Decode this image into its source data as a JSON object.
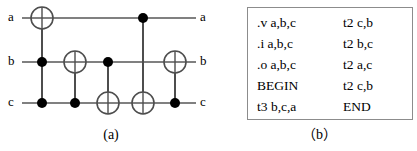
{
  "figure": {
    "panel_a": {
      "caption": "(a)",
      "type": "quantum-circuit",
      "wires": [
        {
          "id": "a",
          "left_label": "a",
          "right_label": "a",
          "y": 18
        },
        {
          "id": "b",
          "left_label": "b",
          "right_label": "b",
          "y": 62
        },
        {
          "id": "c",
          "left_label": "c",
          "right_label": "c",
          "y": 103
        }
      ],
      "wire_start_x": 22,
      "wire_end_x": 196,
      "control_radius": 5,
      "target_radius": 11,
      "gates": [
        {
          "index": 1,
          "name": "toffoli",
          "x": 42,
          "target_wire": "a",
          "control_wires": [
            "b",
            "c"
          ],
          "maps_to": "t3 b,c,a"
        },
        {
          "index": 2,
          "name": "cnot",
          "x": 75,
          "target_wire": "b",
          "control_wires": [
            "c"
          ],
          "maps_to": "t2 c,b"
        },
        {
          "index": 3,
          "name": "cnot",
          "x": 108,
          "target_wire": "c",
          "control_wires": [
            "b"
          ],
          "maps_to": "t2 b,c"
        },
        {
          "index": 4,
          "name": "cnot",
          "x": 143,
          "target_wire": "c",
          "control_wires": [
            "a"
          ],
          "maps_to": "t2 a,c"
        },
        {
          "index": 5,
          "name": "cnot",
          "x": 175,
          "target_wire": "b",
          "control_wires": [
            "c"
          ],
          "maps_to": "t2 c,b"
        }
      ],
      "colors": {
        "wire": "#808080",
        "gate_outline": "#4d4d4d",
        "control_dot": "#000000",
        "text": "#000000"
      }
    },
    "panel_b": {
      "caption": "（b）",
      "type": "code-listing",
      "columns": {
        "left": [
          ".v a,b,c",
          ".i a,b,c",
          ".o a,b,c",
          "BEGIN",
          "t3 b,c,a"
        ],
        "right": [
          "t2 c,b",
          "t2 b,c",
          "t2 a,c",
          "t2 c,b",
          "END"
        ]
      },
      "colors": {
        "border": "#8c8c8c",
        "background": "#ffffff",
        "text": "#000000"
      }
    }
  }
}
